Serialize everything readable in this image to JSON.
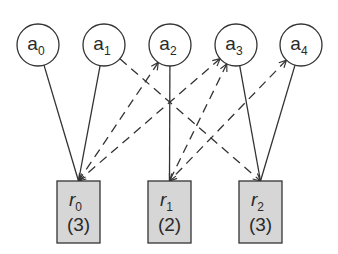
{
  "diagram": {
    "type": "bipartite-allocation-graph",
    "colors": {
      "stroke": "#333333",
      "resource_fill": "#d6d6d6",
      "agent_fill": "#ffffff",
      "background": "#ffffff"
    },
    "agents": [
      {
        "id": "a0",
        "base": "a",
        "sub": "0",
        "cx": 38,
        "cy": 45
      },
      {
        "id": "a1",
        "base": "a",
        "sub": "1",
        "cx": 104,
        "cy": 45
      },
      {
        "id": "a2",
        "base": "a",
        "sub": "2",
        "cx": 170,
        "cy": 45
      },
      {
        "id": "a3",
        "base": "a",
        "sub": "3",
        "cx": 236,
        "cy": 45
      },
      {
        "id": "a4",
        "base": "a",
        "sub": "4",
        "cx": 301,
        "cy": 45
      }
    ],
    "resources": [
      {
        "id": "r0",
        "base": "r",
        "sub": "0",
        "capacity": "(3)",
        "x": 57,
        "y": 181
      },
      {
        "id": "r1",
        "base": "r",
        "sub": "1",
        "capacity": "(2)",
        "x": 148,
        "y": 181
      },
      {
        "id": "r2",
        "base": "r",
        "sub": "2",
        "capacity": "(3)",
        "x": 239,
        "y": 181
      }
    ],
    "edges": [
      {
        "from": "a0",
        "to": "r0",
        "style": "solid"
      },
      {
        "from": "a1",
        "to": "r0",
        "style": "solid"
      },
      {
        "from": "a2",
        "to": "r1",
        "style": "solid"
      },
      {
        "from": "a3",
        "to": "r2",
        "style": "solid"
      },
      {
        "from": "a4",
        "to": "r2",
        "style": "solid"
      },
      {
        "from": "a1",
        "to": "r2",
        "style": "dashed",
        "arrow": "end"
      },
      {
        "from": "a2",
        "to": "r0",
        "style": "dashed",
        "arrow": "both"
      },
      {
        "from": "a3",
        "to": "r0",
        "style": "dashed",
        "arrow": "both"
      },
      {
        "from": "a3",
        "to": "r1",
        "style": "dashed",
        "arrow": "both"
      },
      {
        "from": "a4",
        "to": "r1",
        "style": "dashed",
        "arrow": "both"
      }
    ]
  }
}
